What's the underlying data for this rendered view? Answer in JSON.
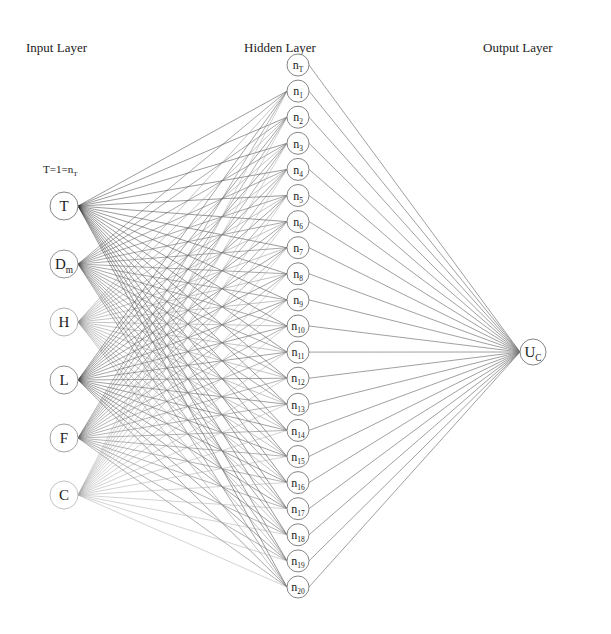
{
  "titles": {
    "input": "Input Layer",
    "hidden": "Hidden Layer",
    "output": "Output Layer"
  },
  "annotation": {
    "text": "T=1=n",
    "sub": "T"
  },
  "input_nodes": [
    {
      "label": "T",
      "sub": "",
      "y": 206,
      "line_color": "#3a3a3a",
      "text_color": "#222222",
      "stroke": "#777777"
    },
    {
      "label": "D",
      "sub": "m",
      "y": 264,
      "line_color": "#555555",
      "text_color": "#333333",
      "stroke": "#888888"
    },
    {
      "label": "H",
      "sub": "",
      "y": 322,
      "line_color": "#8a8a8a",
      "text_color": "#777777",
      "stroke": "#aaaaaa"
    },
    {
      "label": "L",
      "sub": "",
      "y": 380,
      "line_color": "#4a4a4a",
      "text_color": "#333333",
      "stroke": "#888888"
    },
    {
      "label": "F",
      "sub": "",
      "y": 438,
      "line_color": "#6a6a6a",
      "text_color": "#555555",
      "stroke": "#999999"
    },
    {
      "label": "C",
      "sub": "",
      "y": 495,
      "line_color": "#a8a8a8",
      "text_color": "#999999",
      "stroke": "#bbbbbb"
    }
  ],
  "hidden_nodes": [
    {
      "label": "n",
      "sub": "T"
    },
    {
      "label": "n",
      "sub": "1"
    },
    {
      "label": "n",
      "sub": "2"
    },
    {
      "label": "n",
      "sub": "3"
    },
    {
      "label": "n",
      "sub": "4"
    },
    {
      "label": "n",
      "sub": "5"
    },
    {
      "label": "n",
      "sub": "6"
    },
    {
      "label": "n",
      "sub": "7"
    },
    {
      "label": "n",
      "sub": "8"
    },
    {
      "label": "n",
      "sub": "9"
    },
    {
      "label": "n",
      "sub": "10"
    },
    {
      "label": "n",
      "sub": "11"
    },
    {
      "label": "n",
      "sub": "12"
    },
    {
      "label": "n",
      "sub": "13"
    },
    {
      "label": "n",
      "sub": "14"
    },
    {
      "label": "n",
      "sub": "15"
    },
    {
      "label": "n",
      "sub": "16"
    },
    {
      "label": "n",
      "sub": "17"
    },
    {
      "label": "n",
      "sub": "18"
    },
    {
      "label": "n",
      "sub": "19"
    },
    {
      "label": "n",
      "sub": "20"
    }
  ],
  "output_node": {
    "label": "U",
    "sub": "C"
  },
  "layout": {
    "input_x": 64,
    "input_r": 14,
    "hidden_x": 298,
    "hidden_r": 11,
    "hidden_y0": 65,
    "hidden_y_end": 587,
    "output_x": 533,
    "output_y": 352,
    "output_r": 13,
    "hidden_to_output_color": "#777777"
  }
}
